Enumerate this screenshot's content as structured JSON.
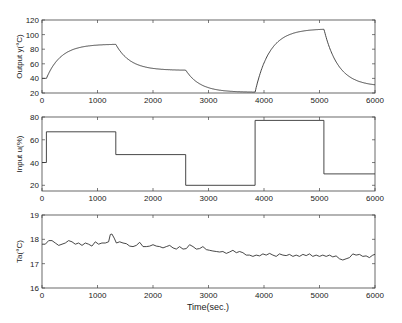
{
  "figure": {
    "xlabel": "Time(sec.)",
    "line_color": "#333333",
    "axis_color": "#444444"
  },
  "chart_data": [
    {
      "type": "line",
      "title": "",
      "xlabel": "",
      "ylabel": "Output y(°C)",
      "xlim": [
        0,
        6000
      ],
      "ylim": [
        20,
        120
      ],
      "xticks": [
        0,
        1000,
        2000,
        3000,
        4000,
        5000,
        6000
      ],
      "yticks": [
        20,
        40,
        60,
        80,
        100,
        120
      ],
      "grid": false,
      "box": [
        42,
        20,
        375,
        93
      ],
      "model": "first_order_steps",
      "y0": 40,
      "tau": 260,
      "segments": [
        {
          "t_start": 0,
          "t_end": 80,
          "target": 40
        },
        {
          "t_start": 80,
          "t_end": 1330,
          "target": 87
        },
        {
          "t_start": 1330,
          "t_end": 2590,
          "target": 51
        },
        {
          "t_start": 2590,
          "t_end": 3840,
          "target": 21
        },
        {
          "t_start": 3840,
          "t_end": 5080,
          "target": 108
        },
        {
          "t_start": 5080,
          "t_end": 6000,
          "target": 29
        }
      ],
      "series": [
        {
          "name": "Output y",
          "x": [
            0,
            80,
            300,
            600,
            1000,
            1330,
            1600,
            2000,
            2590,
            2900,
            3300,
            3840,
            4100,
            4500,
            5080,
            5400,
            6000
          ],
          "values": [
            40,
            40,
            72,
            82,
            86,
            87,
            70,
            56,
            51,
            31,
            24,
            22,
            80,
            100,
            107,
            60,
            31
          ]
        }
      ]
    },
    {
      "type": "line",
      "title": "",
      "xlabel": "",
      "ylabel": "Input u(%)",
      "xlim": [
        0,
        6000
      ],
      "ylim": [
        15,
        80
      ],
      "xticks": [
        0,
        1000,
        2000,
        3000,
        4000,
        5000,
        6000
      ],
      "yticks": [
        20,
        40,
        60,
        80
      ],
      "grid": false,
      "box": [
        42,
        117,
        375,
        191
      ],
      "model": "step",
      "series": [
        {
          "name": "Input u",
          "x": [
            0,
            80,
            80,
            1330,
            1330,
            2590,
            2590,
            3840,
            3840,
            5080,
            5080,
            6000
          ],
          "values": [
            40,
            40,
            67,
            67,
            47,
            47,
            20,
            20,
            77,
            77,
            30,
            30
          ]
        }
      ]
    },
    {
      "type": "line",
      "title": "",
      "xlabel": "Time(sec.)",
      "ylabel": "Ta(°C)",
      "xlim": [
        0,
        6000
      ],
      "ylim": [
        16,
        19
      ],
      "xticks": [
        0,
        1000,
        2000,
        3000,
        4000,
        5000,
        6000
      ],
      "yticks": [
        16,
        17,
        18,
        19
      ],
      "grid": false,
      "box": [
        42,
        215,
        375,
        288
      ],
      "model": "polyline",
      "series": [
        {
          "name": "Ta",
          "x": [
            0,
            60,
            120,
            180,
            240,
            300,
            360,
            420,
            480,
            540,
            600,
            660,
            720,
            780,
            840,
            900,
            960,
            1020,
            1080,
            1140,
            1200,
            1230,
            1260,
            1300,
            1340,
            1400,
            1460,
            1520,
            1580,
            1640,
            1700,
            1760,
            1820,
            1880,
            1940,
            2000,
            2060,
            2120,
            2180,
            2240,
            2300,
            2360,
            2420,
            2480,
            2540,
            2600,
            2660,
            2720,
            2780,
            2840,
            2900,
            2960,
            3020,
            3080,
            3140,
            3200,
            3260,
            3320,
            3380,
            3440,
            3500,
            3560,
            3620,
            3680,
            3740,
            3800,
            3860,
            3920,
            3980,
            4040,
            4100,
            4160,
            4220,
            4280,
            4340,
            4400,
            4460,
            4520,
            4580,
            4640,
            4700,
            4760,
            4820,
            4880,
            4940,
            5000,
            5060,
            5120,
            5180,
            5240,
            5300,
            5360,
            5420,
            5480,
            5540,
            5600,
            5660,
            5720,
            5780,
            5840,
            5900,
            5960,
            6000
          ],
          "values": [
            17.8,
            17.8,
            17.95,
            17.95,
            17.85,
            17.75,
            17.8,
            17.85,
            17.95,
            17.9,
            17.8,
            17.85,
            17.75,
            17.85,
            17.8,
            17.72,
            17.9,
            17.8,
            17.85,
            17.85,
            17.9,
            18.2,
            18.22,
            18.05,
            17.85,
            17.9,
            17.85,
            17.82,
            17.72,
            17.7,
            17.75,
            17.88,
            17.7,
            17.7,
            17.72,
            17.78,
            17.72,
            17.7,
            17.65,
            17.7,
            17.75,
            17.65,
            17.6,
            17.7,
            17.6,
            17.62,
            17.78,
            17.7,
            17.6,
            17.62,
            17.7,
            17.58,
            17.55,
            17.52,
            17.5,
            17.48,
            17.5,
            17.42,
            17.48,
            17.55,
            17.45,
            17.5,
            17.45,
            17.35,
            17.35,
            17.3,
            17.35,
            17.32,
            17.4,
            17.35,
            17.42,
            17.35,
            17.3,
            17.4,
            17.35,
            17.33,
            17.38,
            17.3,
            17.35,
            17.3,
            17.38,
            17.33,
            17.4,
            17.3,
            17.35,
            17.3,
            17.35,
            17.3,
            17.35,
            17.28,
            17.32,
            17.2,
            17.15,
            17.2,
            17.25,
            17.4,
            17.35,
            17.38,
            17.3,
            17.32,
            17.25,
            17.35,
            17.38
          ]
        }
      ]
    }
  ]
}
